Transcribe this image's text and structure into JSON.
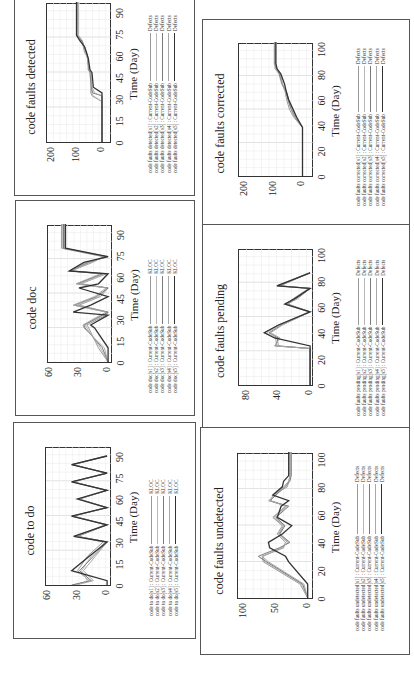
{
  "page": {
    "orientation": "rotated-90-ccw",
    "panel_count": 6
  },
  "panels": [
    {
      "id": "detected",
      "title": "code faults detected",
      "xlabel": "Time (Day)",
      "xticks": [
        "0",
        "15",
        "30",
        "45",
        "60",
        "75",
        "90"
      ],
      "yticks": [
        "200",
        "100",
        "0"
      ],
      "legend": [
        {
          "name": "code faults detected[s1] : Current-CodeSub",
          "unit": "Defects"
        },
        {
          "name": "code faults detected[s2] : Current-CodeSub",
          "unit": "Defects"
        },
        {
          "name": "code faults detected[s3] : Current-CodeSub",
          "unit": "Defects"
        },
        {
          "name": "code faults detected[s4] : Current-CodeSub",
          "unit": "Defects"
        },
        {
          "name": "code faults detected[s5] : Current-CodeSub",
          "unit": "Defects"
        }
      ]
    },
    {
      "id": "doc",
      "title": "code doc",
      "xlabel": "Time (Day)",
      "xticks": [
        "0",
        "15",
        "30",
        "45",
        "60",
        "75",
        "90"
      ],
      "yticks": [
        "60",
        "30",
        "0"
      ],
      "legend": [
        {
          "name": "code doc[s1] : Current-CodeSub",
          "unit": "KLOC"
        },
        {
          "name": "code doc[s2] : Current-CodeSub",
          "unit": "KLOC"
        },
        {
          "name": "code doc[s3] : Current-CodeSub",
          "unit": "KLOC"
        },
        {
          "name": "code doc[s4] : Current-CodeSub",
          "unit": "KLOC"
        },
        {
          "name": "code doc[s5] : Current-CodeSub",
          "unit": "KLOC"
        }
      ]
    },
    {
      "id": "todo",
      "title": "code to do",
      "xlabel": "Time (Day)",
      "xticks": [
        "0",
        "15",
        "30",
        "45",
        "60",
        "75",
        "90"
      ],
      "yticks": [
        "60",
        "30",
        "0"
      ],
      "legend": [
        {
          "name": "code to do[s1] : Current-CodeSub",
          "unit": "KLOC"
        },
        {
          "name": "code to do[s2] : Current-CodeSub",
          "unit": "KLOC"
        },
        {
          "name": "code to do[s3] : Current-CodeSub",
          "unit": "KLOC"
        },
        {
          "name": "code to do[s4] : Current-CodeSub",
          "unit": "KLOC"
        },
        {
          "name": "code to do[s5] : Current-CodeSub",
          "unit": "KLOC"
        }
      ]
    },
    {
      "id": "corrected",
      "title": "code faults corrected",
      "xlabel": "Time (Day)",
      "xticks": [
        "0",
        "20",
        "40",
        "60",
        "80",
        "100"
      ],
      "yticks": [
        "200",
        "100",
        "0"
      ],
      "legend": [
        {
          "name": "code faults corrected[s1] : Current-CodeSub",
          "unit": "Defects"
        },
        {
          "name": "code faults corrected[s2] : Current-CodeSub",
          "unit": "Defects"
        },
        {
          "name": "code faults corrected[s3] : Current-CodeSub",
          "unit": "Defects"
        },
        {
          "name": "code faults corrected[s4] : Current-CodeSub",
          "unit": "Defects"
        },
        {
          "name": "code faults corrected[s5] : Current-CodeSub",
          "unit": "Defects"
        }
      ]
    },
    {
      "id": "pending",
      "title": "code faults pending",
      "xlabel": "Time (Day)",
      "xticks": [
        "0",
        "20",
        "40",
        "60",
        "80",
        "100"
      ],
      "yticks": [
        "80",
        "40",
        "0"
      ],
      "legend": [
        {
          "name": "code faults pending[s1] : Current-CodeSub",
          "unit": "Defects"
        },
        {
          "name": "code faults pending[s2] : Current-CodeSub",
          "unit": "Defects"
        },
        {
          "name": "code faults pending[s3] : Current-CodeSub",
          "unit": "Defects"
        },
        {
          "name": "code faults pending[s4] : Current-CodeSub",
          "unit": "Defects"
        },
        {
          "name": "code faults pending[s5] : Current-CodeSub",
          "unit": "Defects"
        }
      ]
    },
    {
      "id": "undetected",
      "title": "code faults undetected",
      "xlabel": "Time (Day)",
      "xticks": [
        "0",
        "20",
        "40",
        "60",
        "80",
        "100"
      ],
      "yticks": [
        "100",
        "50",
        "0"
      ],
      "legend": [
        {
          "name": "code faults undetected[s1] : Current-CodeSub",
          "unit": "Defects"
        },
        {
          "name": "code faults undetected[s2] : Current-CodeSub",
          "unit": "Defects"
        },
        {
          "name": "code faults undetected[s3] : Current-CodeSub",
          "unit": "Defects"
        },
        {
          "name": "code faults undetected[s4] : Current-CodeSub",
          "unit": "Defects"
        },
        {
          "name": "code faults undetected[s5] : Current-CodeSub",
          "unit": "Defects"
        }
      ]
    }
  ],
  "series_colors": [
    "#9a9a9a",
    "#b8b8b8",
    "#7a7a7a",
    "#a8a8a8",
    "#333333"
  ],
  "chart_data": [
    {
      "type": "line",
      "title": "code faults detected",
      "xlabel": "Time (Day)",
      "ylabel": "Defects",
      "xlim": [
        0,
        97
      ],
      "ylim": [
        -40,
        220
      ],
      "grid": true,
      "legend_position": "bottom",
      "x": [
        0,
        28,
        32,
        34,
        38,
        48,
        50,
        58,
        62,
        66,
        70,
        74,
        97
      ],
      "series": [
        {
          "name": "code faults detected[s1] : Current-CodeSub",
          "values": [
            0,
            0,
            40,
            45,
            45,
            45,
            55,
            55,
            70,
            75,
            80,
            95,
            95
          ]
        },
        {
          "name": "code faults detected[s2] : Current-CodeSub",
          "values": [
            0,
            0,
            35,
            42,
            45,
            48,
            55,
            58,
            65,
            72,
            78,
            95,
            95
          ]
        },
        {
          "name": "code faults detected[s3] : Current-CodeSub",
          "values": [
            0,
            0,
            0,
            38,
            42,
            48,
            52,
            58,
            62,
            70,
            80,
            100,
            100
          ]
        },
        {
          "name": "code faults detected[s4] : Current-CodeSub",
          "values": [
            0,
            0,
            0,
            30,
            40,
            45,
            50,
            58,
            65,
            70,
            85,
            100,
            100
          ]
        },
        {
          "name": "code faults detected[s5] : Current-CodeSub",
          "values": [
            0,
            0,
            0,
            0,
            35,
            40,
            48,
            55,
            62,
            70,
            88,
            102,
            102
          ]
        }
      ]
    },
    {
      "type": "line",
      "title": "code doc",
      "xlabel": "Time (Day)",
      "ylabel": "KLOC",
      "xlim": [
        0,
        97
      ],
      "ylim": [
        -5,
        62
      ],
      "grid": true,
      "legend_position": "bottom",
      "x": [
        0,
        10,
        24,
        26,
        33,
        35,
        40,
        46,
        52,
        55,
        62,
        64,
        70,
        74,
        80,
        97
      ],
      "series": [
        {
          "name": "code doc[s1] : Current-CodeSub",
          "values": [
            0,
            10,
            20,
            22,
            2,
            0,
            30,
            8,
            0,
            28,
            2,
            38,
            16,
            5,
            48,
            48
          ]
        },
        {
          "name": "code doc[s2] : Current-CodeSub",
          "values": [
            0,
            8,
            22,
            24,
            4,
            0,
            32,
            10,
            0,
            30,
            4,
            39,
            18,
            4,
            47,
            47
          ]
        },
        {
          "name": "code doc[s3] : Current-CodeSub",
          "values": [
            0,
            6,
            24,
            25,
            6,
            0,
            35,
            12,
            0,
            32,
            6,
            40,
            20,
            2,
            46,
            46
          ]
        },
        {
          "name": "code doc[s4] : Current-CodeSub",
          "values": [
            0,
            4,
            25,
            26,
            8,
            2,
            36,
            14,
            2,
            33,
            8,
            40,
            22,
            0,
            45,
            45
          ]
        },
        {
          "name": "code doc[s5] : Current-CodeSub",
          "values": [
            0,
            0,
            14,
            18,
            0,
            36,
            18,
            0,
            30,
            10,
            0,
            40,
            25,
            0,
            44,
            44
          ]
        }
      ]
    },
    {
      "type": "line",
      "title": "code to do",
      "xlabel": "Time (Day)",
      "ylabel": "KLOC",
      "xlim": [
        0,
        97
      ],
      "ylim": [
        -5,
        62
      ],
      "grid": true,
      "legend_position": "bottom",
      "x": [
        0,
        3,
        10,
        20,
        30,
        34,
        42,
        48,
        54,
        60,
        66,
        72,
        78,
        84,
        90
      ],
      "series": [
        {
          "name": "code to do[s1] : Current-CodeSub",
          "values": [
            34,
            18,
            30,
            20,
            4,
            30,
            0,
            36,
            0,
            28,
            0,
            36,
            0,
            36,
            0
          ]
        },
        {
          "name": "code to do[s2] : Current-CodeSub",
          "values": [
            30,
            20,
            26,
            16,
            2,
            32,
            2,
            34,
            2,
            30,
            2,
            34,
            2,
            34,
            2
          ]
        },
        {
          "name": "code to do[s3] : Current-CodeSub",
          "values": [
            36,
            16,
            28,
            14,
            0,
            30,
            0,
            35,
            0,
            29,
            0,
            35,
            0,
            35,
            0
          ]
        },
        {
          "name": "code to do[s4] : Current-CodeSub",
          "values": [
            32,
            14,
            24,
            12,
            0,
            31,
            1,
            34,
            1,
            28,
            1,
            34,
            1,
            34,
            1
          ]
        },
        {
          "name": "code to do[s5] : Current-CodeSub",
          "values": [
            0,
            0,
            36,
            18,
            0,
            34,
            0,
            36,
            0,
            30,
            0,
            36,
            0,
            36,
            0
          ]
        }
      ]
    },
    {
      "type": "line",
      "title": "code faults corrected",
      "xlabel": "Time (Day)",
      "ylabel": "Defects",
      "xlim": [
        0,
        105
      ],
      "ylim": [
        -40,
        220
      ],
      "grid": true,
      "legend_position": "bottom",
      "x": [
        0,
        38,
        46,
        52,
        60,
        66,
        72,
        80,
        84,
        88,
        105
      ],
      "series": [
        {
          "name": "code faults corrected[s1] : Current-CodeSub",
          "values": [
            0,
            0,
            30,
            45,
            55,
            60,
            70,
            80,
            95,
            95,
            95
          ]
        },
        {
          "name": "code faults corrected[s2] : Current-CodeSub",
          "values": [
            0,
            0,
            28,
            40,
            52,
            58,
            72,
            82,
            92,
            98,
            98
          ]
        },
        {
          "name": "code faults corrected[s3] : Current-CodeSub",
          "values": [
            0,
            0,
            25,
            38,
            50,
            56,
            70,
            80,
            90,
            96,
            96
          ]
        },
        {
          "name": "code faults corrected[s4] : Current-CodeSub",
          "values": [
            0,
            0,
            22,
            35,
            48,
            55,
            68,
            78,
            88,
            94,
            94
          ]
        },
        {
          "name": "code faults corrected[s5] : Current-CodeSub",
          "values": [
            0,
            0,
            20,
            32,
            48,
            56,
            62,
            75,
            88,
            92,
            92
          ]
        }
      ]
    },
    {
      "type": "line",
      "title": "code faults pending",
      "xlabel": "Time (Day)",
      "ylabel": "Defects",
      "xlim": [
        0,
        105
      ],
      "ylim": [
        -5,
        90
      ],
      "grid": true,
      "legend_position": "bottom",
      "x": [
        0,
        28,
        30,
        36,
        40,
        46,
        56,
        62,
        66,
        74,
        76,
        86
      ],
      "series": [
        {
          "name": "code faults pending[s1] : Current-CodeSub",
          "values": [
            0,
            0,
            40,
            42,
            58,
            40,
            0,
            32,
            20,
            0,
            42,
            0
          ]
        },
        {
          "name": "code faults pending[s2] : Current-CodeSub",
          "values": [
            0,
            0,
            42,
            44,
            55,
            38,
            2,
            30,
            22,
            2,
            40,
            2
          ]
        },
        {
          "name": "code faults pending[s3] : Current-CodeSub",
          "values": [
            0,
            0,
            44,
            40,
            52,
            36,
            0,
            28,
            18,
            0,
            38,
            0
          ]
        },
        {
          "name": "code faults pending[s4] : Current-CodeSub",
          "values": [
            0,
            0,
            45,
            38,
            50,
            35,
            0,
            30,
            16,
            0,
            40,
            0
          ]
        },
        {
          "name": "code faults pending[s5] : Current-CodeSub",
          "values": [
            0,
            0,
            0,
            45,
            58,
            40,
            0,
            32,
            20,
            0,
            42,
            0
          ]
        }
      ]
    },
    {
      "type": "line",
      "title": "code faults undetected",
      "xlabel": "Time (Day)",
      "ylabel": "Defects",
      "xlim": [
        0,
        105
      ],
      "ylim": [
        -10,
        110
      ],
      "grid": true,
      "legend_position": "bottom",
      "x": [
        0,
        10,
        26,
        30,
        36,
        40,
        46,
        52,
        58,
        66,
        70,
        74,
        80,
        84,
        88,
        105
      ],
      "series": [
        {
          "name": "code faults undetected[s1] : Current-CodeSub",
          "values": [
            0,
            12,
            70,
            72,
            38,
            35,
            48,
            40,
            55,
            35,
            58,
            55,
            32,
            30,
            28,
            28
          ]
        },
        {
          "name": "code faults undetected[s2] : Current-CodeSub",
          "values": [
            0,
            10,
            68,
            70,
            42,
            30,
            45,
            38,
            52,
            32,
            62,
            52,
            34,
            30,
            26,
            26
          ]
        },
        {
          "name": "code faults undetected[s3] : Current-CodeSub",
          "values": [
            0,
            8,
            65,
            78,
            45,
            28,
            44,
            36,
            50,
            30,
            60,
            50,
            36,
            28,
            26,
            26
          ]
        },
        {
          "name": "code faults undetected[s4] : Current-CodeSub",
          "values": [
            0,
            6,
            62,
            72,
            40,
            32,
            46,
            38,
            54,
            34,
            60,
            52,
            38,
            30,
            27,
            27
          ]
        },
        {
          "name": "code faults undetected[s5] : Current-CodeSub",
          "values": [
            0,
            0,
            30,
            35,
            60,
            62,
            40,
            25,
            48,
            42,
            30,
            55,
            40,
            38,
            30,
            30
          ]
        }
      ]
    }
  ]
}
